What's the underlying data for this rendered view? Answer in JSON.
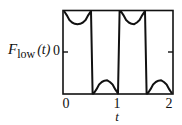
{
  "chart_data": {
    "type": "line",
    "title": "",
    "xlabel": "t",
    "ylabel": "F_low (t)",
    "ylabel_parts": {
      "main": "F",
      "sub": "low",
      "arg": "(t)"
    },
    "xlim": [
      0,
      2
    ],
    "ylim": [
      -1,
      1
    ],
    "xticks": [
      "0",
      "1",
      "2"
    ],
    "yticks": [
      "0"
    ],
    "grid": false,
    "legend": null,
    "series": [
      {
        "name": "F_low(t)",
        "x": [
          0.0,
          0.05,
          0.1,
          0.15,
          0.2,
          0.25,
          0.3,
          0.35,
          0.4,
          0.45,
          0.5,
          0.53,
          0.55,
          0.6,
          0.65,
          0.7,
          0.75,
          0.8,
          0.85,
          0.9,
          0.95,
          1.0,
          1.03,
          1.05,
          1.1,
          1.15,
          1.2,
          1.25,
          1.3,
          1.35,
          1.4,
          1.45,
          1.5,
          1.53,
          1.55,
          1.6,
          1.65,
          1.7,
          1.75,
          1.8,
          1.85,
          1.9,
          1.95,
          2.0
        ],
        "y": [
          1.0,
          0.9,
          0.78,
          0.72,
          0.69,
          0.68,
          0.69,
          0.72,
          0.78,
          0.9,
          1.0,
          -1.0,
          -1.0,
          -0.9,
          -0.78,
          -0.72,
          -0.69,
          -0.68,
          -0.72,
          -0.78,
          -0.9,
          -1.0,
          1.0,
          1.0,
          0.9,
          0.78,
          0.72,
          0.69,
          0.68,
          0.72,
          0.78,
          0.9,
          1.0,
          -1.0,
          -1.0,
          -0.9,
          -0.78,
          -0.72,
          -0.69,
          -0.68,
          -0.72,
          -0.78,
          -0.9,
          -1.0
        ]
      }
    ],
    "colors": {
      "line": "#111111",
      "frame": "#111111",
      "background": "#ffffff"
    }
  },
  "labels": {
    "ylabel_main": "F",
    "ylabel_sub": "low",
    "ylabel_arg": "(t)",
    "ytick_zero": "0",
    "xtick_0": "0",
    "xtick_1": "1",
    "xtick_2": "2",
    "xlabel": "t"
  }
}
